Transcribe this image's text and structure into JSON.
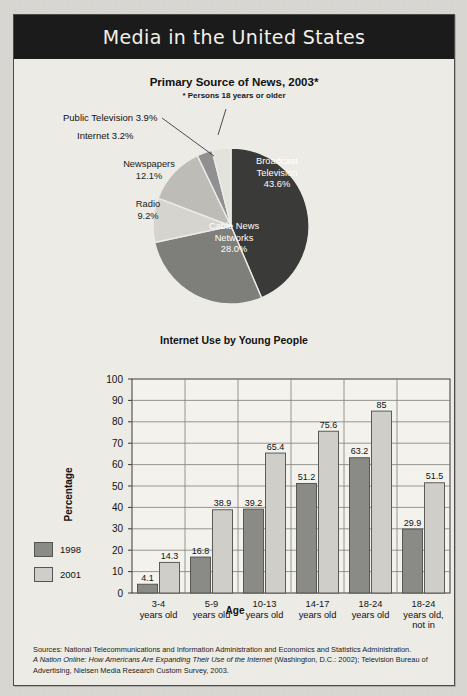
{
  "page": {
    "title": "Media in the United States",
    "background_color": "#d9d8d3",
    "panel_color": "#ecebe6",
    "banner_color": "#1b1b1b"
  },
  "pie_chart": {
    "title": "Primary Source of News, 2003*",
    "subtitle": "* Persons 18 years or older",
    "labels": {
      "public_television": "Public Television 3.9%",
      "internet": "Internet 3.2%",
      "newspapers_name": "Newspapers",
      "newspapers_value": "12.1%",
      "radio_name": "Radio",
      "radio_value": "9.2%",
      "broadcast_line1": "Broadcast",
      "broadcast_line2": "Television",
      "broadcast_value": "43.6%",
      "cable_line1": "Cable News",
      "cable_line2": "Networks",
      "cable_value": "28.0%"
    }
  },
  "bar_chart": {
    "title": "Internet Use by Young People",
    "xlabel": "Age",
    "ylabel": "Percentage",
    "legend": [
      {
        "label": "1998",
        "color": "#8a8a86"
      },
      {
        "label": "2001",
        "color": "#cfcec8"
      }
    ]
  },
  "chart_data": [
    {
      "type": "pie",
      "title": "Primary Source of News, 2003*",
      "subtitle": "* Persons 18 years or older",
      "slices": [
        {
          "label": "Broadcast Television",
          "value": 43.6,
          "color": "#3a3a38"
        },
        {
          "label": "Cable News Networks",
          "value": 28.0,
          "color": "#7e7e7a"
        },
        {
          "label": "Radio",
          "value": 9.2,
          "color": "#d5d4ce"
        },
        {
          "label": "Newspapers",
          "value": 12.1,
          "color": "#bdbcb6"
        },
        {
          "label": "Internet",
          "value": 3.2,
          "color": "#909090"
        },
        {
          "label": "Public Television",
          "value": 3.9,
          "color": "#e3e2dc"
        }
      ],
      "units": "percent",
      "legend_position": "labels-on-slices"
    },
    {
      "type": "bar",
      "title": "Internet Use by Young People",
      "xlabel": "Age",
      "ylabel": "Percentage",
      "ylim": [
        0,
        100
      ],
      "yticks": [
        0,
        10,
        20,
        30,
        40,
        50,
        60,
        70,
        80,
        90,
        100
      ],
      "grid": true,
      "categories": [
        "3-4\nyears old",
        "5-9\nyears old",
        "10-13\nyears old",
        "14-17\nyears old",
        "18-24\nyears old",
        "18-24\nyears old,\nnot in\nschool"
      ],
      "series": [
        {
          "name": "1998",
          "color": "#8a8a86",
          "values": [
            4.1,
            16.8,
            39.2,
            51.2,
            63.2,
            29.9
          ]
        },
        {
          "name": "2001",
          "color": "#cfcec8",
          "values": [
            14.3,
            38.9,
            65.4,
            75.6,
            85,
            51.5
          ]
        }
      ],
      "legend_position": "left"
    }
  ],
  "sources": {
    "line1": "Sources: National Telecommunications and Information Administration and Economics and Statistics Administration.",
    "italic_title": "A Nation Online: How Americans Are Expanding Their Use of the Internet",
    "line2_rest": " (Washington, D.C.: 2002); Television Bureau of",
    "line3": "Advertising, Nielsen Media Research Custom Survey, 2003."
  }
}
